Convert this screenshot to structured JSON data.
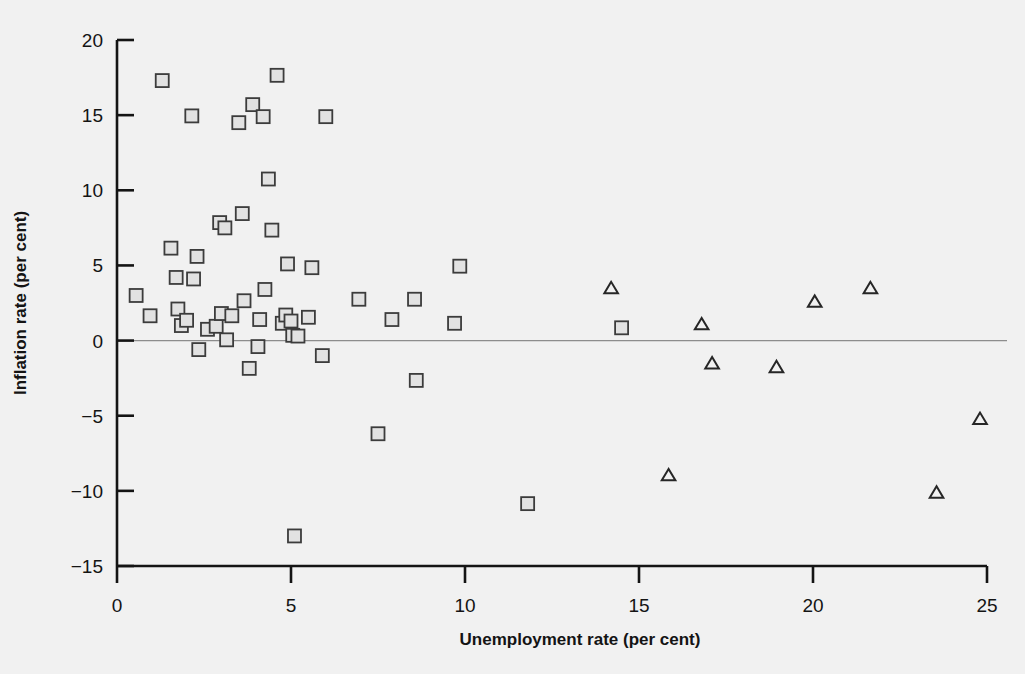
{
  "chart_data": {
    "type": "scatter",
    "title": "",
    "xlabel": "Unemployment rate (per cent)",
    "ylabel": "Inflation rate (per cent)",
    "xlim": [
      0,
      25
    ],
    "ylim": [
      -15,
      20
    ],
    "xticks": [
      "0",
      "5",
      "10",
      "15",
      "20",
      "25"
    ],
    "xtick_values": [
      0,
      5,
      10,
      15,
      20,
      25
    ],
    "yticks": [
      "20",
      "15",
      "10",
      "5",
      "0",
      "-5",
      "-10",
      "-15"
    ],
    "ytick_values": [
      20,
      15,
      10,
      5,
      0,
      -5,
      -10,
      -15
    ],
    "grid": false,
    "zero_line": true,
    "legend": null,
    "marker_colors": {
      "square_stroke": "#3c3c3c",
      "square_fill": "#e2e2e2",
      "triangle_stroke": "#262626",
      "triangle_fill": "#f1f1f1",
      "axis": "#141414",
      "zero_line": "#8d8d8d",
      "background": "#f1f1f1"
    },
    "series": [
      {
        "name": "square-series",
        "marker": "square",
        "points": [
          [
            0.55,
            3.0
          ],
          [
            0.95,
            1.65
          ],
          [
            1.3,
            17.3
          ],
          [
            1.55,
            6.15
          ],
          [
            1.7,
            4.2
          ],
          [
            1.75,
            2.1
          ],
          [
            1.85,
            1.0
          ],
          [
            2.0,
            1.35
          ],
          [
            2.15,
            14.95
          ],
          [
            2.2,
            4.1
          ],
          [
            2.3,
            5.6
          ],
          [
            2.35,
            -0.6
          ],
          [
            2.6,
            0.75
          ],
          [
            2.85,
            0.95
          ],
          [
            2.95,
            7.85
          ],
          [
            3.0,
            1.8
          ],
          [
            3.1,
            7.5
          ],
          [
            3.15,
            0.05
          ],
          [
            3.3,
            1.65
          ],
          [
            3.5,
            14.5
          ],
          [
            3.6,
            8.45
          ],
          [
            3.65,
            2.65
          ],
          [
            3.8,
            -1.85
          ],
          [
            3.9,
            15.7
          ],
          [
            4.05,
            -0.4
          ],
          [
            4.1,
            1.4
          ],
          [
            4.2,
            14.9
          ],
          [
            4.25,
            3.4
          ],
          [
            4.35,
            10.75
          ],
          [
            4.45,
            7.35
          ],
          [
            4.6,
            17.65
          ],
          [
            4.75,
            1.15
          ],
          [
            4.85,
            1.7
          ],
          [
            4.9,
            5.1
          ],
          [
            5.0,
            1.3
          ],
          [
            5.05,
            0.35
          ],
          [
            5.1,
            -13.0
          ],
          [
            5.2,
            0.3
          ],
          [
            5.5,
            1.55
          ],
          [
            5.6,
            4.85
          ],
          [
            5.9,
            -1.0
          ],
          [
            6.0,
            14.9
          ],
          [
            6.95,
            2.75
          ],
          [
            7.5,
            -6.2
          ],
          [
            7.9,
            1.4
          ],
          [
            8.55,
            2.75
          ],
          [
            8.6,
            -2.65
          ],
          [
            9.7,
            1.15
          ],
          [
            9.85,
            4.95
          ],
          [
            11.8,
            -10.85
          ],
          [
            14.5,
            0.85
          ]
        ]
      },
      {
        "name": "triangle-series",
        "marker": "triangle",
        "points": [
          [
            14.2,
            3.5
          ],
          [
            15.85,
            -8.95
          ],
          [
            16.8,
            1.1
          ],
          [
            17.1,
            -1.5
          ],
          [
            18.95,
            -1.75
          ],
          [
            20.05,
            2.6
          ],
          [
            21.65,
            3.5
          ],
          [
            23.55,
            -10.1
          ],
          [
            24.8,
            -5.2
          ]
        ]
      }
    ]
  }
}
